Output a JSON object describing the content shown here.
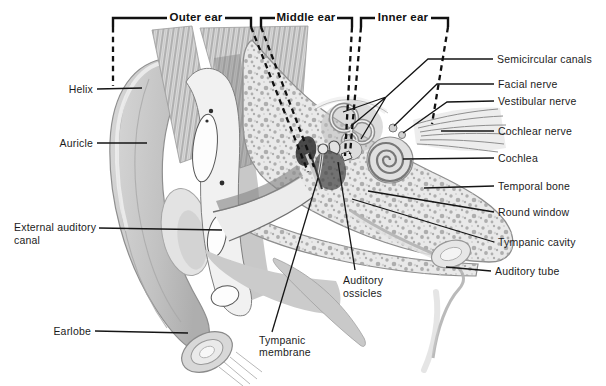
{
  "regions": {
    "outer": "Outer ear",
    "middle": "Middle ear",
    "inner": "Inner ear"
  },
  "labels": {
    "helix": "Helix",
    "auricle": "Auricle",
    "external_auditory_canal": "External auditory canal",
    "earlobe": "Earlobe",
    "semicircular_canals": "Semicircular canals",
    "facial_nerve": "Facial nerve",
    "vestibular_nerve": "Vestibular nerve",
    "cochlear_nerve": "Cochlear nerve",
    "cochlea": "Cochlea",
    "temporal_bone": "Temporal bone",
    "round_window": "Round window",
    "tympanic_cavity": "Tympanic cavity",
    "auditory_tube": "Auditory tube",
    "auditory_ossicles": "Auditory ossicles",
    "tympanic_membrane": "Tympanic membrane"
  },
  "colors": {
    "ink": "#1a1a1a",
    "background": "#ffffff"
  }
}
